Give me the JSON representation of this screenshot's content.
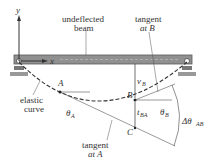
{
  "diagram": {
    "labels": {
      "y_axis": "y",
      "x_axis": "x",
      "undeflected_1": "undeflected",
      "undeflected_2": "beam",
      "tangentB_1": "tangent",
      "tangentB_2": "at B",
      "elastic_1": "elastic",
      "elastic_2": "curve",
      "tangentA_1": "tangent",
      "tangentA_2": "at A",
      "point_A": "A",
      "point_B": "B",
      "point_C": "C",
      "vB": "v",
      "vB_sub": "B",
      "tBA": "t",
      "tBA_sub": "BA",
      "thetaA": "θ",
      "thetaA_sub": "A",
      "thetaB": "θ",
      "thetaB_sub": "B",
      "dtheta": "Δθ",
      "dtheta_sub": "AB"
    },
    "colors": {
      "beam": "#8a8a8a",
      "beam_edge": "#5a5a5a",
      "line": "#333333"
    }
  }
}
